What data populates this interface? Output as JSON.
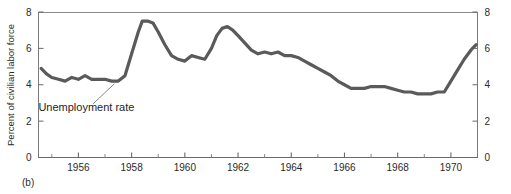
{
  "figure": {
    "panel_label": "(b)",
    "background_color": "#ffffff"
  },
  "chart_data": {
    "type": "line",
    "title": "",
    "subtitle": "",
    "xlabel": "",
    "ylabel": "Percent of civilian labor force",
    "xlim": [
      1954.5,
      1971.0
    ],
    "ylim": [
      0,
      8
    ],
    "grid": false,
    "legend_position": "none",
    "line_color": "#5a5a5a",
    "axis_color": "#6a6a6a",
    "x_tick_labels": [
      "1956",
      "1958",
      "1960",
      "1962",
      "1964",
      "1966",
      "1968",
      "1970"
    ],
    "x_tick_values": [
      1956,
      1958,
      1960,
      1962,
      1964,
      1966,
      1968,
      1970
    ],
    "x_minor_ticks": [
      1955,
      1957,
      1959,
      1961,
      1963,
      1965,
      1967,
      1969
    ],
    "y_tick_labels": [
      "0",
      "2",
      "4",
      "6",
      "8"
    ],
    "y_tick_values": [
      0,
      2,
      4,
      6,
      8
    ],
    "y_axis_right_labels": [
      "0",
      "2",
      "4",
      "6",
      "8"
    ],
    "series": [
      {
        "name": "Unemployment rate",
        "x": [
          1954.6,
          1954.8,
          1955.0,
          1955.25,
          1955.5,
          1955.75,
          1956.0,
          1956.25,
          1956.5,
          1956.75,
          1957.0,
          1957.25,
          1957.5,
          1957.75,
          1958.0,
          1958.25,
          1958.4,
          1958.6,
          1958.8,
          1959.0,
          1959.25,
          1959.5,
          1959.75,
          1960.0,
          1960.25,
          1960.5,
          1960.75,
          1961.0,
          1961.2,
          1961.4,
          1961.6,
          1961.8,
          1962.0,
          1962.25,
          1962.5,
          1962.75,
          1963.0,
          1963.25,
          1963.5,
          1963.75,
          1964.0,
          1964.25,
          1964.5,
          1964.75,
          1965.0,
          1965.25,
          1965.5,
          1965.75,
          1966.0,
          1966.25,
          1966.5,
          1966.75,
          1967.0,
          1967.25,
          1967.5,
          1967.75,
          1968.0,
          1968.25,
          1968.5,
          1968.75,
          1969.0,
          1969.25,
          1969.5,
          1969.75,
          1970.0,
          1970.25,
          1970.5,
          1970.75,
          1970.95
        ],
        "values": [
          4.9,
          4.6,
          4.4,
          4.3,
          4.2,
          4.4,
          4.3,
          4.5,
          4.3,
          4.3,
          4.3,
          4.2,
          4.2,
          4.5,
          5.7,
          6.9,
          7.5,
          7.5,
          7.4,
          6.9,
          6.2,
          5.6,
          5.4,
          5.3,
          5.6,
          5.5,
          5.4,
          6.0,
          6.7,
          7.1,
          7.2,
          7.0,
          6.7,
          6.3,
          5.9,
          5.7,
          5.8,
          5.7,
          5.8,
          5.6,
          5.6,
          5.5,
          5.3,
          5.1,
          4.9,
          4.7,
          4.5,
          4.2,
          4.0,
          3.8,
          3.8,
          3.8,
          3.9,
          3.9,
          3.9,
          3.8,
          3.7,
          3.6,
          3.6,
          3.5,
          3.5,
          3.5,
          3.6,
          3.6,
          4.2,
          4.8,
          5.4,
          5.9,
          6.2
        ]
      }
    ],
    "annotations": [
      {
        "text": "Unemployment rate",
        "text_x": 1956.3,
        "text_y": 2.55,
        "leader_from_x": 1956.55,
        "leader_from_y": 2.95,
        "leader_to_x": 1957.35,
        "leader_to_y": 4.05
      }
    ]
  }
}
